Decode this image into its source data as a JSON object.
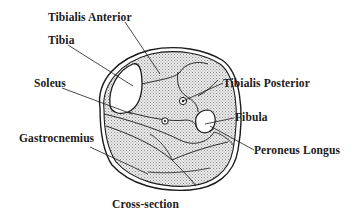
{
  "diagram": {
    "title": "Cross-section",
    "labels": {
      "tibialis_anterior": "Tibialis Anterior",
      "tibia": "Tibia",
      "soleus": "Soleus",
      "tibialis_posterior": "Tibialis Posterior",
      "fibula": "Fibula",
      "gastrocnemius": "Gastrocnemius",
      "peroneus_longus": "Peroneus Longus"
    },
    "colors": {
      "line": "#1a1a1a",
      "muscle_fill": "#c8c8c8",
      "bone_fill": "#ffffff",
      "background": "#ffffff"
    }
  }
}
